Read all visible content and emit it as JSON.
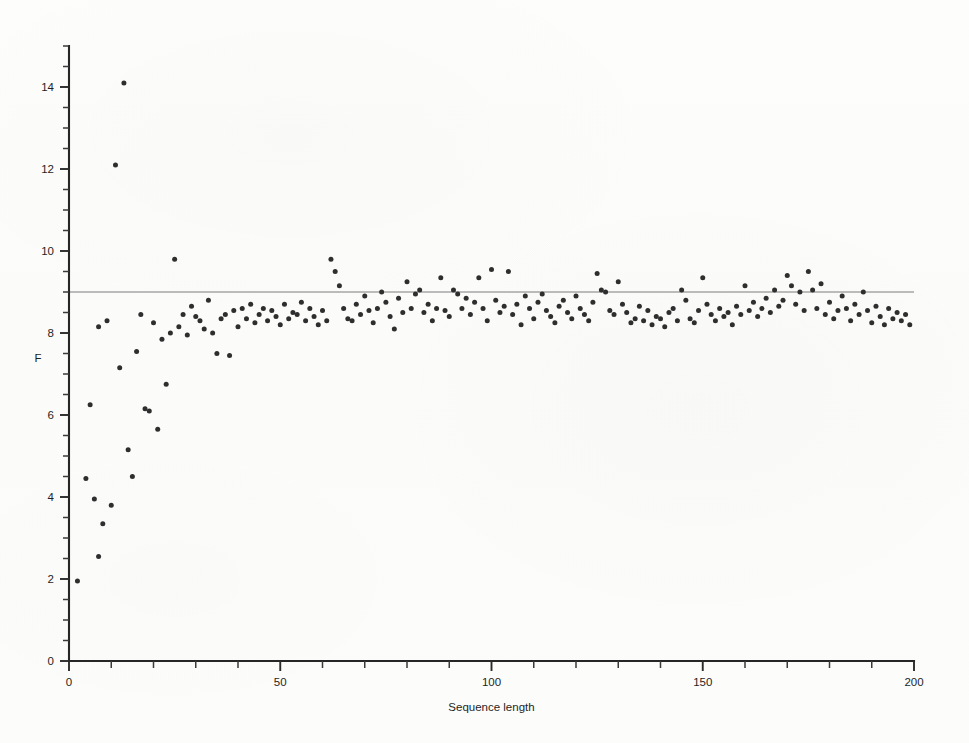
{
  "figure": {
    "background_color": "#fcfcfb",
    "point_color": "#2e2e2e",
    "axis_color": "#262626",
    "reference_line_color": "#7d7d7d"
  },
  "chart_data": {
    "type": "scatter",
    "title": "",
    "subtitle": "",
    "xlabel": "Sequence length",
    "ylabel": "F",
    "xlim": [
      0,
      200
    ],
    "ylim": [
      0,
      15
    ],
    "grid": false,
    "legend": null,
    "x_ticks": [
      0,
      50,
      100,
      150,
      200
    ],
    "x_tick_labels": [
      "0",
      "50",
      "100",
      "150",
      "200"
    ],
    "x_minor_tick_step": 10,
    "y_ticks": [
      0,
      2,
      4,
      6,
      8,
      10,
      12,
      14
    ],
    "y_tick_labels": [
      "0",
      "2",
      "4",
      "6",
      "8",
      "10",
      "12",
      "14"
    ],
    "y_minor_tick_step": 0.5,
    "annotations": [
      {
        "type": "horizontal-line",
        "y": 9.0,
        "label": "",
        "color": "#7d7d7d"
      }
    ],
    "series": [
      {
        "name": "F",
        "marker": "filled-circle",
        "marker_size_px": 5,
        "color": "#2e2e2e",
        "points": [
          [
            2,
            1.95
          ],
          [
            4,
            4.45
          ],
          [
            5,
            6.25
          ],
          [
            6,
            3.95
          ],
          [
            7,
            2.55
          ],
          [
            7,
            8.15
          ],
          [
            8,
            3.35
          ],
          [
            9,
            8.3
          ],
          [
            10,
            3.8
          ],
          [
            11,
            12.1
          ],
          [
            12,
            7.15
          ],
          [
            13,
            14.1
          ],
          [
            14,
            5.15
          ],
          [
            15,
            4.5
          ],
          [
            16,
            7.55
          ],
          [
            17,
            8.45
          ],
          [
            18,
            6.15
          ],
          [
            19,
            6.1
          ],
          [
            20,
            8.25
          ],
          [
            21,
            5.65
          ],
          [
            22,
            7.85
          ],
          [
            23,
            6.75
          ],
          [
            24,
            8.0
          ],
          [
            25,
            9.8
          ],
          [
            26,
            8.15
          ],
          [
            27,
            8.45
          ],
          [
            28,
            7.95
          ],
          [
            29,
            8.65
          ],
          [
            30,
            8.4
          ],
          [
            31,
            8.3
          ],
          [
            32,
            8.1
          ],
          [
            33,
            8.8
          ],
          [
            34,
            8.0
          ],
          [
            35,
            7.5
          ],
          [
            36,
            8.35
          ],
          [
            37,
            8.45
          ],
          [
            38,
            7.45
          ],
          [
            39,
            8.55
          ],
          [
            40,
            8.15
          ],
          [
            41,
            8.6
          ],
          [
            42,
            8.35
          ],
          [
            43,
            8.7
          ],
          [
            44,
            8.25
          ],
          [
            45,
            8.45
          ],
          [
            46,
            8.6
          ],
          [
            47,
            8.3
          ],
          [
            48,
            8.55
          ],
          [
            49,
            8.4
          ],
          [
            50,
            8.2
          ],
          [
            51,
            8.7
          ],
          [
            52,
            8.35
          ],
          [
            53,
            8.5
          ],
          [
            54,
            8.45
          ],
          [
            55,
            8.75
          ],
          [
            56,
            8.3
          ],
          [
            57,
            8.6
          ],
          [
            58,
            8.4
          ],
          [
            59,
            8.2
          ],
          [
            60,
            8.55
          ],
          [
            61,
            8.3
          ],
          [
            62,
            9.8
          ],
          [
            63,
            9.5
          ],
          [
            64,
            9.15
          ],
          [
            65,
            8.6
          ],
          [
            66,
            8.35
          ],
          [
            67,
            8.3
          ],
          [
            68,
            8.7
          ],
          [
            69,
            8.45
          ],
          [
            70,
            8.9
          ],
          [
            71,
            8.55
          ],
          [
            72,
            8.25
          ],
          [
            73,
            8.6
          ],
          [
            74,
            9.0
          ],
          [
            75,
            8.75
          ],
          [
            76,
            8.4
          ],
          [
            77,
            8.1
          ],
          [
            78,
            8.85
          ],
          [
            79,
            8.5
          ],
          [
            80,
            9.25
          ],
          [
            81,
            8.6
          ],
          [
            82,
            8.95
          ],
          [
            83,
            9.05
          ],
          [
            84,
            8.5
          ],
          [
            85,
            8.7
          ],
          [
            86,
            8.3
          ],
          [
            87,
            8.6
          ],
          [
            88,
            9.35
          ],
          [
            89,
            8.55
          ],
          [
            90,
            8.4
          ],
          [
            91,
            9.05
          ],
          [
            92,
            8.95
          ],
          [
            93,
            8.6
          ],
          [
            94,
            8.85
          ],
          [
            95,
            8.45
          ],
          [
            96,
            8.75
          ],
          [
            97,
            9.35
          ],
          [
            98,
            8.6
          ],
          [
            99,
            8.3
          ],
          [
            100,
            9.55
          ],
          [
            101,
            8.8
          ],
          [
            102,
            8.5
          ],
          [
            103,
            8.65
          ],
          [
            104,
            9.5
          ],
          [
            105,
            8.45
          ],
          [
            106,
            8.7
          ],
          [
            107,
            8.2
          ],
          [
            108,
            8.9
          ],
          [
            109,
            8.6
          ],
          [
            110,
            8.35
          ],
          [
            111,
            8.75
          ],
          [
            112,
            8.95
          ],
          [
            113,
            8.55
          ],
          [
            114,
            8.4
          ],
          [
            115,
            8.25
          ],
          [
            116,
            8.65
          ],
          [
            117,
            8.8
          ],
          [
            118,
            8.5
          ],
          [
            119,
            8.35
          ],
          [
            120,
            8.9
          ],
          [
            121,
            8.6
          ],
          [
            122,
            8.45
          ],
          [
            123,
            8.3
          ],
          [
            124,
            8.75
          ],
          [
            125,
            9.45
          ],
          [
            126,
            9.05
          ],
          [
            127,
            9.0
          ],
          [
            128,
            8.55
          ],
          [
            129,
            8.45
          ],
          [
            130,
            9.25
          ],
          [
            131,
            8.7
          ],
          [
            132,
            8.5
          ],
          [
            133,
            8.25
          ],
          [
            134,
            8.35
          ],
          [
            135,
            8.65
          ],
          [
            136,
            8.3
          ],
          [
            137,
            8.55
          ],
          [
            138,
            8.2
          ],
          [
            139,
            8.4
          ],
          [
            140,
            8.35
          ],
          [
            141,
            8.15
          ],
          [
            142,
            8.5
          ],
          [
            143,
            8.6
          ],
          [
            144,
            8.3
          ],
          [
            145,
            9.05
          ],
          [
            146,
            8.8
          ],
          [
            147,
            8.35
          ],
          [
            148,
            8.25
          ],
          [
            149,
            8.55
          ],
          [
            150,
            9.35
          ],
          [
            151,
            8.7
          ],
          [
            152,
            8.45
          ],
          [
            153,
            8.3
          ],
          [
            154,
            8.6
          ],
          [
            155,
            8.4
          ],
          [
            156,
            8.5
          ],
          [
            157,
            8.2
          ],
          [
            158,
            8.65
          ],
          [
            159,
            8.45
          ],
          [
            160,
            9.15
          ],
          [
            161,
            8.55
          ],
          [
            162,
            8.75
          ],
          [
            163,
            8.4
          ],
          [
            164,
            8.6
          ],
          [
            165,
            8.85
          ],
          [
            166,
            8.5
          ],
          [
            167,
            9.05
          ],
          [
            168,
            8.65
          ],
          [
            169,
            8.8
          ],
          [
            170,
            9.4
          ],
          [
            171,
            9.15
          ],
          [
            172,
            8.7
          ],
          [
            173,
            9.0
          ],
          [
            174,
            8.55
          ],
          [
            175,
            9.5
          ],
          [
            176,
            9.05
          ],
          [
            177,
            8.6
          ],
          [
            178,
            9.2
          ],
          [
            179,
            8.45
          ],
          [
            180,
            8.75
          ],
          [
            181,
            8.35
          ],
          [
            182,
            8.55
          ],
          [
            183,
            8.9
          ],
          [
            184,
            8.6
          ],
          [
            185,
            8.3
          ],
          [
            186,
            8.7
          ],
          [
            187,
            8.45
          ],
          [
            188,
            9.0
          ],
          [
            189,
            8.55
          ],
          [
            190,
            8.25
          ],
          [
            191,
            8.65
          ],
          [
            192,
            8.4
          ],
          [
            193,
            8.2
          ],
          [
            194,
            8.6
          ],
          [
            195,
            8.35
          ],
          [
            196,
            8.5
          ],
          [
            197,
            8.3
          ],
          [
            198,
            8.45
          ],
          [
            199,
            8.2
          ]
        ]
      }
    ]
  }
}
